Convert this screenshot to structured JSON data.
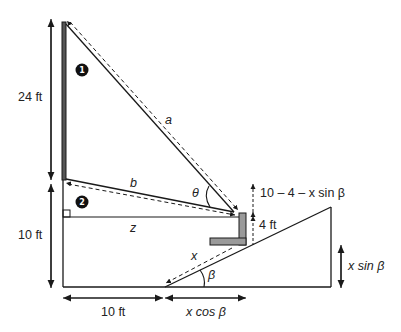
{
  "diagram": {
    "labels": {
      "height_top": "24 ft",
      "height_bottom": "10 ft",
      "base_left": "10 ft",
      "base_right": "x cos β",
      "ramp_height": "x sin β",
      "eye_offset": "10 – 4 – x sin β",
      "person_height": "4 ft",
      "side_a": "a",
      "side_b": "b",
      "side_z": "z",
      "side_x": "x",
      "angle_theta": "θ",
      "angle_beta": "β",
      "marker_1": "1",
      "marker_2": "2"
    },
    "colors": {
      "stroke": "#1a1a1a",
      "pole_fill": "#555555",
      "person_fill": "#9a9a9a",
      "marker_fill": "#111111"
    }
  }
}
